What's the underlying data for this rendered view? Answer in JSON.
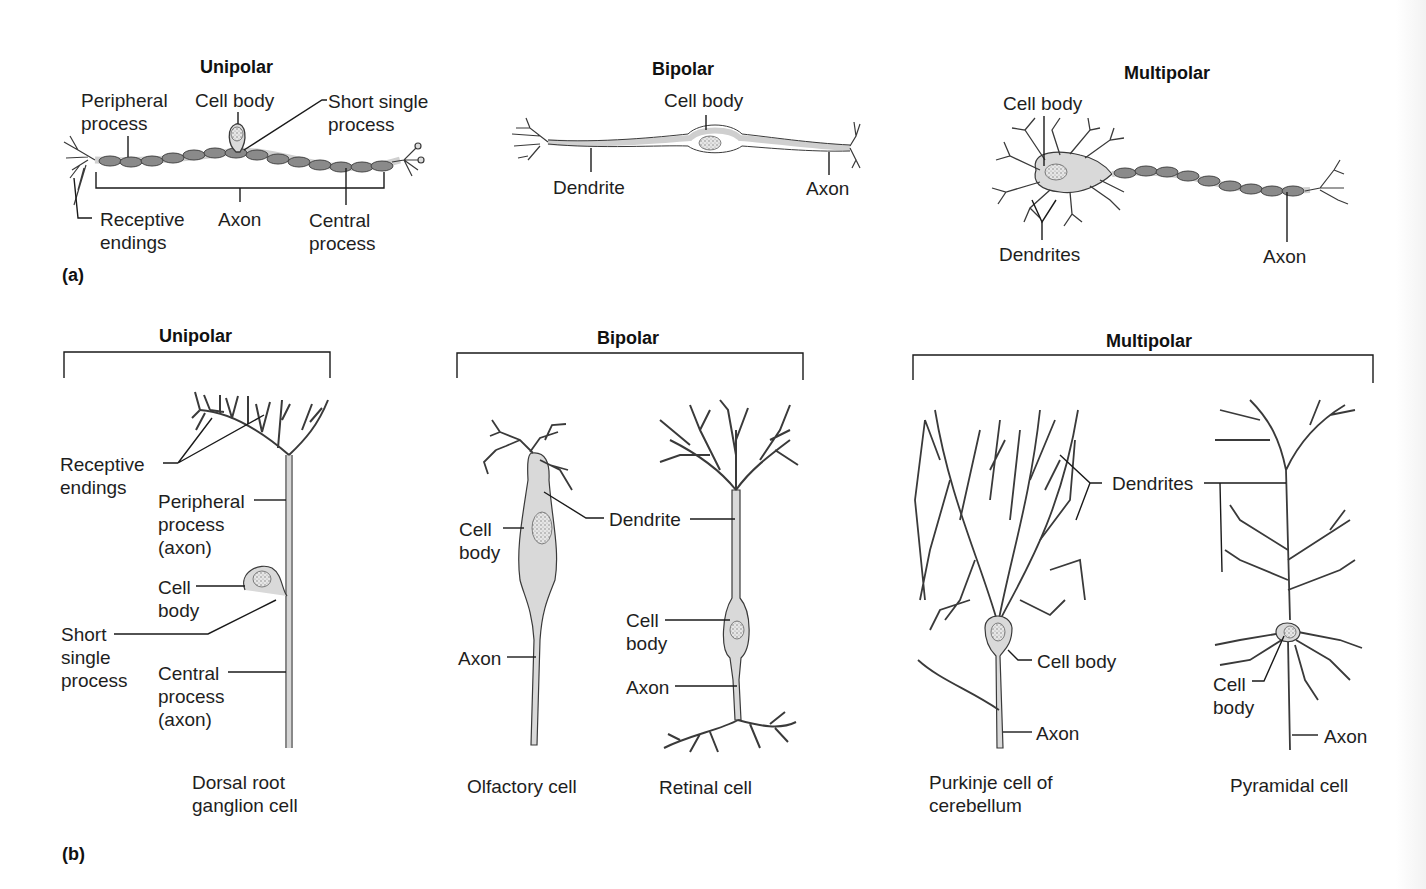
{
  "figure": {
    "colors": {
      "outline": "#3a3a3a",
      "cell_fill": "#d9d9d9",
      "myelin_fill": "#8a8a8a",
      "leader_line": "#1a1a1a",
      "background": "#ffffff"
    },
    "panel_a": {
      "tag": "(a)",
      "unipolar": {
        "title": "Unipolar",
        "labels": {
          "peripheral_process": "Peripheral\nprocess",
          "cell_body": "Cell body",
          "short_single_process": "Short single\nprocess",
          "receptive_endings": "Receptive\nendings",
          "axon": "Axon",
          "central_process": "Central\nprocess"
        }
      },
      "bipolar": {
        "title": "Bipolar",
        "labels": {
          "cell_body": "Cell body",
          "dendrite": "Dendrite",
          "axon": "Axon"
        }
      },
      "multipolar": {
        "title": "Multipolar",
        "labels": {
          "cell_body": "Cell body",
          "dendrites": "Dendrites",
          "axon": "Axon"
        }
      }
    },
    "panel_b": {
      "tag": "(b)",
      "unipolar": {
        "title": "Unipolar",
        "cells": [
          {
            "caption": "Dorsal root\nganglion cell",
            "labels": {
              "receptive_endings": "Receptive\nendings",
              "peripheral_process": "Peripheral\nprocess\n(axon)",
              "cell_body": "Cell\nbody",
              "short_single_process": "Short\nsingle\nprocess",
              "central_process": "Central\nprocess\n(axon)"
            }
          }
        ]
      },
      "bipolar": {
        "title": "Bipolar",
        "shared_label": "Dendrite",
        "cells": [
          {
            "caption": "Olfactory cell",
            "labels": {
              "cell_body": "Cell\nbody",
              "axon": "Axon"
            }
          },
          {
            "caption": "Retinal cell",
            "labels": {
              "cell_body": "Cell\nbody",
              "axon": "Axon"
            }
          }
        ]
      },
      "multipolar": {
        "title": "Multipolar",
        "shared_label": "Dendrites",
        "cells": [
          {
            "caption": "Purkinje cell of\ncerebellum",
            "labels": {
              "cell_body": "Cell body",
              "axon": "Axon"
            }
          },
          {
            "caption": "Pyramidal cell",
            "labels": {
              "cell_body": "Cell\nbody",
              "axon": "Axon"
            }
          }
        ]
      }
    }
  }
}
